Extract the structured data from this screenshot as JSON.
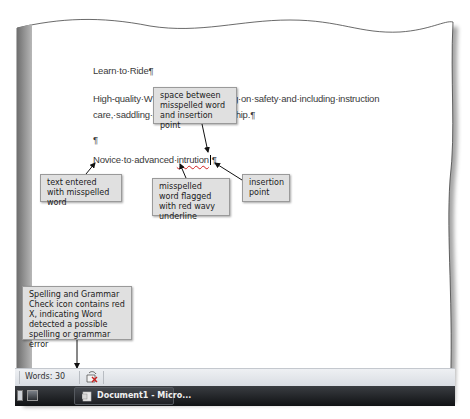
{
  "document": {
    "title_line": "Learn·to·Ride¶",
    "para1": "High-quality·W                              ng·lessons,·focusing·on·safety·and·including·instruction",
    "para2": "care,·saddling·a                                ects·of·horsemanship.¶",
    "empty_paragraph": "¶",
    "novice_prefix": "Novice·to·advanced·",
    "misspelled_word": "intrution",
    "novice_suffix": "¶"
  },
  "callouts": {
    "space_between": "space between misspelled word and insertion point",
    "text_entered": "text entered with misspelled word",
    "misspelled_flagged": "misspelled word flagged with red wavy underline",
    "insertion_point": "insertion point",
    "spelling_icon": "Spelling and Grammar Check icon contains red X, indicating Word detected a possible spelling or grammar error"
  },
  "status_bar": {
    "words": "Words: 30",
    "spelling_icon": "spelling-grammar-check-icon"
  },
  "taskbar": {
    "active_window": "Document1 - Micro..."
  },
  "colors": {
    "underline": "#d02020",
    "callout_bg": "#e0e0e0",
    "taskbar": "#1a1c1f"
  }
}
